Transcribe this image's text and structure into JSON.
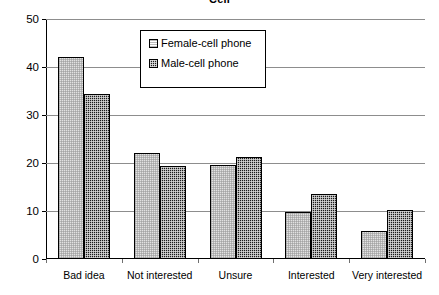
{
  "chart_data": {
    "type": "bar",
    "title": "Cell",
    "categories": [
      "Bad idea",
      "Not interested",
      "Unsure",
      "Interested",
      "Very interested"
    ],
    "series": [
      {
        "name": "Female-cell phone",
        "values": [
          42.0,
          22.0,
          19.5,
          9.8,
          5.8
        ]
      },
      {
        "name": "Male-cell phone",
        "values": [
          34.3,
          19.3,
          21.2,
          13.6,
          10.3
        ]
      }
    ],
    "xlabel": "",
    "ylabel": "",
    "ylim": [
      0,
      50
    ],
    "yticks": [
      0,
      10,
      20,
      30,
      40,
      50
    ],
    "ytick_labels": [
      "0",
      "10",
      "20",
      "30",
      "40",
      "50"
    ],
    "grid": true,
    "legend_position": "upper center",
    "colors": {
      "female": "#e2e2e2",
      "male": "#1b1b1b",
      "axis": "#000000",
      "gridline": "#8d8d8d",
      "background": "#ffffff"
    }
  },
  "legend": {
    "items": [
      {
        "label": "Female-cell phone",
        "pattern": "light-dither"
      },
      {
        "label": "Male-cell phone",
        "pattern": "dark-checker"
      }
    ]
  }
}
